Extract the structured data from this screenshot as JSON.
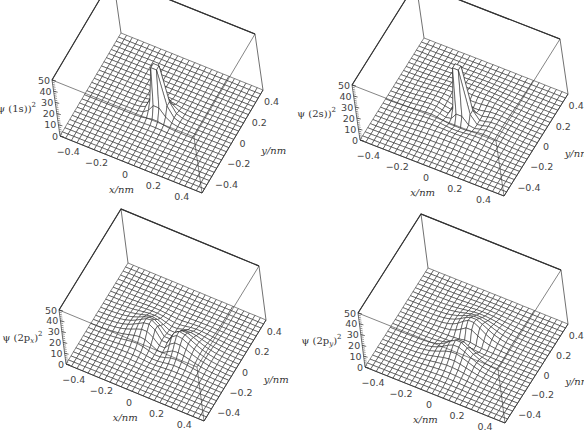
{
  "chart_data": [
    {
      "type": "surface",
      "panel": "top-left",
      "title": "",
      "zlabel": "ψ(1s)²",
      "zlabel_parts": {
        "pre": "ψ (1s)",
        "sub": "",
        "sup": "2"
      },
      "xlabel": "x/nm",
      "ylabel": "y/nm",
      "xlim": [
        -0.5,
        0.5
      ],
      "ylim": [
        -0.5,
        0.5
      ],
      "zlim": [
        0,
        50
      ],
      "x_ticks": [
        "-0.4",
        "-0.2",
        "0",
        "0.2",
        "0.4"
      ],
      "y_ticks": [
        "-0.4",
        "-0.2",
        "0",
        "0.2",
        "0.4"
      ],
      "z_ticks": [
        "0",
        "10",
        "20",
        "30",
        "40",
        "50"
      ],
      "function": "1s",
      "peak_clipped_at": 50,
      "grid_lines": 25
    },
    {
      "type": "surface",
      "panel": "top-right",
      "title": "",
      "zlabel": "ψ(2s)²",
      "zlabel_parts": {
        "pre": "ψ (2s)",
        "sub": "",
        "sup": "2"
      },
      "xlabel": "x/nm",
      "ylabel": "y/nm",
      "xlim": [
        -0.5,
        0.5
      ],
      "ylim": [
        -0.5,
        0.5
      ],
      "zlim": [
        0,
        50
      ],
      "x_ticks": [
        "-0.4",
        "-0.2",
        "0",
        "0.2",
        "0.4"
      ],
      "y_ticks": [
        "-0.4",
        "-0.2",
        "0",
        "0.2",
        "0.4"
      ],
      "z_ticks": [
        "0",
        "10",
        "20",
        "30",
        "40",
        "50"
      ],
      "function": "2s",
      "peak_clipped_at": 50,
      "grid_lines": 25
    },
    {
      "type": "surface",
      "panel": "bottom-left",
      "title": "",
      "zlabel": "ψ(2p_x)²",
      "zlabel_parts": {
        "pre": "ψ (2p",
        "sub": "x",
        "sup": "2"
      },
      "xlabel": "x/nm",
      "ylabel": "y/nm",
      "xlim": [
        -0.5,
        0.5
      ],
      "ylim": [
        -0.5,
        0.5
      ],
      "zlim": [
        0,
        50
      ],
      "x_ticks": [
        "-0.4",
        "-0.2",
        "0",
        "0.2",
        "0.4"
      ],
      "y_ticks": [
        "-0.4",
        "-0.2",
        "0",
        "0.2",
        "0.4"
      ],
      "z_ticks": [
        "0",
        "10",
        "20",
        "30",
        "40",
        "50"
      ],
      "function": "2px",
      "peak_max_approx": 28,
      "grid_lines": 25
    },
    {
      "type": "surface",
      "panel": "bottom-right",
      "title": "",
      "zlabel": "ψ(2p_y)²",
      "zlabel_parts": {
        "pre": "ψ (2p",
        "sub": "y",
        "sup": "2"
      },
      "xlabel": "x/nm",
      "ylabel": "y/nm",
      "xlim": [
        -0.5,
        0.5
      ],
      "ylim": [
        -0.5,
        0.5
      ],
      "zlim": [
        0,
        50
      ],
      "x_ticks": [
        "-0.4",
        "-0.2",
        "0",
        "0.2",
        "0.4"
      ],
      "y_ticks": [
        "-0.4",
        "-0.2",
        "0",
        "0.2",
        "0.4"
      ],
      "z_ticks": [
        "0",
        "10",
        "20",
        "30",
        "40",
        "50"
      ],
      "function": "2py",
      "peak_max_approx": 28,
      "grid_lines": 25
    }
  ],
  "panels": [
    {
      "left": 0,
      "top": 0,
      "geom": {
        "back_top": [
          138,
          10
        ],
        "right_top": [
          268,
          44
        ],
        "left_top": [
          52,
          80
        ],
        "left_floor": [
          60,
          136
        ],
        "front_floor": [
          202,
          193
        ],
        "right_floor": [
          263,
          90
        ]
      }
    },
    {
      "left": 292,
      "top": 0,
      "geom": {
        "back_top": [
          146,
          13
        ],
        "right_top": [
          278,
          49
        ],
        "left_top": [
          60,
          85
        ],
        "left_floor": [
          68,
          140
        ],
        "front_floor": [
          212,
          196
        ],
        "right_floor": [
          276,
          94
        ]
      }
    },
    {
      "left": 0,
      "top": 217,
      "geom": {
        "back_top": [
          142,
          24
        ],
        "right_top": [
          269,
          58
        ],
        "left_top": [
          59,
          93
        ],
        "left_floor": [
          66,
          147
        ],
        "front_floor": [
          204,
          204
        ],
        "right_floor": [
          266,
          103
        ]
      }
    },
    {
      "left": 292,
      "top": 217,
      "geom": {
        "back_top": [
          150,
          26
        ],
        "right_top": [
          279,
          62
        ],
        "left_top": [
          66,
          96
        ],
        "left_floor": [
          73,
          150
        ],
        "front_floor": [
          213,
          206
        ],
        "right_floor": [
          276,
          107
        ]
      }
    }
  ],
  "colors": {
    "line": "#222222",
    "box": "#333333",
    "surface_fill": "#ffffff",
    "text": "#444444"
  }
}
